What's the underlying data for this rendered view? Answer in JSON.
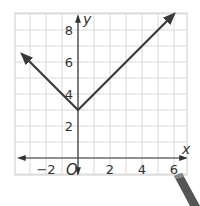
{
  "chart_data": {
    "type": "line",
    "title": "",
    "xlabel": "x",
    "ylabel": "y",
    "origin_label": "O",
    "xlim": [
      -4,
      7
    ],
    "ylim": [
      -1,
      9
    ],
    "grid": true,
    "x_ticks": [
      -2,
      2,
      4,
      6
    ],
    "y_ticks": [
      2,
      4,
      6,
      8
    ],
    "x_tick_labels": [
      "−2",
      "2",
      "4",
      "6"
    ],
    "y_tick_labels": [
      "2",
      "4",
      "6",
      "8"
    ],
    "series": [
      {
        "name": "absolute value function",
        "points": [
          [
            -3.5,
            6.5
          ],
          [
            0,
            3
          ],
          [
            6,
            9
          ]
        ],
        "vertex": [
          0,
          3
        ],
        "arrows_at_ends": true
      }
    ],
    "colors": {
      "grid": "#d9d9d9",
      "axes": "#333333",
      "line": "#3a3a3a",
      "border": "#cccccc"
    }
  }
}
